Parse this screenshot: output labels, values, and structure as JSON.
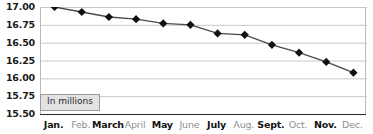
{
  "chart_data": {
    "type": "line",
    "title": "",
    "xlabel": "",
    "ylabel": "",
    "annotation": "In millions",
    "grid": true,
    "legend": "none",
    "ylim": [
      15.5,
      17.0
    ],
    "ytick_step": 0.25,
    "ytick_labels": [
      "17.00",
      "16.75",
      "16.50",
      "16.25",
      "16.00",
      "15.75",
      "15.50"
    ],
    "ytick_values": [
      17.0,
      16.75,
      16.5,
      16.25,
      16.0,
      15.75,
      15.5
    ],
    "categories": [
      "Jan.",
      "Feb.",
      "March",
      "April",
      "May",
      "June",
      "July",
      "Aug.",
      "Sept.",
      "Oct.",
      "Nov.",
      "Dec."
    ],
    "category_emphasis": [
      true,
      false,
      true,
      false,
      true,
      false,
      true,
      false,
      true,
      false,
      true,
      false
    ],
    "values": [
      17.0,
      16.93,
      16.86,
      16.83,
      16.77,
      16.75,
      16.63,
      16.61,
      16.47,
      16.36,
      16.23,
      16.08
    ],
    "marker": "diamond",
    "marker_color": "#111111",
    "line_color": "#4a4a4a",
    "gridline_color": "#c8c8c8",
    "axis_color": "#2b2b2b"
  }
}
